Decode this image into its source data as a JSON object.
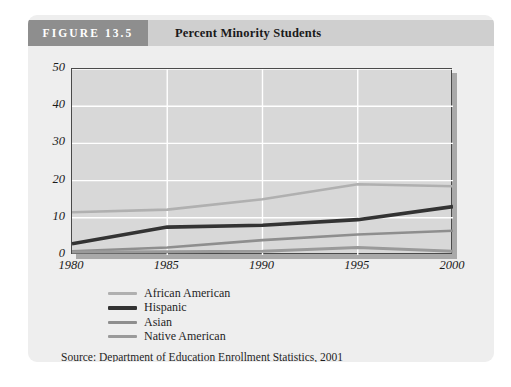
{
  "figure": {
    "number_label": "FIGURE 13.5",
    "title": "Percent Minority Students",
    "source": "Source: Department of Education Enrollment Statistics, 2001"
  },
  "colors": {
    "header_number_band": "#8e8e8e",
    "header_title_band": "#cfcfcf",
    "card_background": "#eeeeee",
    "plot_background": "#d8d8d8",
    "plot_border": "#4a4a4a",
    "gridline": "#ffffff",
    "shadow": "#a9a9a9",
    "african_american": "#b0b0b0",
    "hispanic": "#333333",
    "asian": "#8e8e8e",
    "native_american": "#9a9a9a"
  },
  "legend": {
    "items": [
      {
        "label": "African American",
        "color": "#b0b0b0",
        "width": 2.6
      },
      {
        "label": "Hispanic",
        "color": "#333333",
        "width": 3.6
      },
      {
        "label": "Asian",
        "color": "#8e8e8e",
        "width": 2.6
      },
      {
        "label": "Native American",
        "color": "#9a9a9a",
        "width": 3.0
      }
    ]
  },
  "chart_data": {
    "type": "line",
    "title": "Percent Minority Students",
    "xlabel": "",
    "ylabel": "",
    "x": [
      1980,
      1985,
      1990,
      1995,
      2000
    ],
    "xticklabels": [
      "1980",
      "1985",
      "1990",
      "1995",
      "2000"
    ],
    "yticks": [
      0,
      10,
      20,
      30,
      40,
      50
    ],
    "yticklabels": [
      "0",
      "10",
      "20",
      "30",
      "40",
      "50"
    ],
    "xlim": [
      1980,
      2000
    ],
    "ylim": [
      0,
      50
    ],
    "grid": true,
    "legend_position": "below-left",
    "series": [
      {
        "name": "African American",
        "values": [
          11.5,
          12.2,
          15.0,
          19.0,
          18.5
        ]
      },
      {
        "name": "Hispanic",
        "values": [
          3.0,
          7.5,
          8.0,
          9.5,
          13.0
        ]
      },
      {
        "name": "Asian",
        "values": [
          1.0,
          2.0,
          4.0,
          5.5,
          6.5
        ]
      },
      {
        "name": "Native American",
        "values": [
          0.8,
          0.9,
          1.0,
          2.0,
          1.0
        ]
      }
    ]
  }
}
